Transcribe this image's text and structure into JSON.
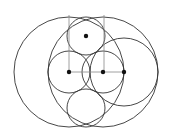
{
  "diagram": {
    "title": "",
    "stroke_color": "#333333",
    "line_color": "#888888",
    "point_color": "#111111",
    "circles": [
      {
        "name": "big-left-circle",
        "cx": 69,
        "cy": 72,
        "r": 55
      },
      {
        "name": "big-right-circle",
        "cx": 103,
        "cy": 72,
        "r": 55
      },
      {
        "name": "right-medium-circle",
        "cx": 124,
        "cy": 72,
        "r": 34
      },
      {
        "name": "top-small-circle",
        "cx": 86,
        "cy": 36,
        "r": 19
      },
      {
        "name": "bottom-small-circle",
        "cx": 86,
        "cy": 108,
        "r": 19
      },
      {
        "name": "middle-left-circle",
        "cx": 69,
        "cy": 72,
        "r": 21
      },
      {
        "name": "middle-right-circle",
        "cx": 103,
        "cy": 72,
        "r": 21
      }
    ],
    "lines": [
      {
        "name": "vertical-line-left",
        "x1": 69,
        "y1": 15,
        "x2": 69,
        "y2": 72
      },
      {
        "name": "vertical-line-right",
        "x1": 104,
        "y1": 15,
        "x2": 104,
        "y2": 72
      },
      {
        "name": "horizontal-line",
        "x1": 69,
        "y1": 72,
        "x2": 124,
        "y2": 72
      }
    ],
    "points": [
      {
        "name": "point-top",
        "x": 86,
        "y": 36
      },
      {
        "name": "point-left",
        "x": 69,
        "y": 72
      },
      {
        "name": "point-middle",
        "x": 103,
        "y": 72
      },
      {
        "name": "point-right",
        "x": 124,
        "y": 72
      }
    ]
  }
}
